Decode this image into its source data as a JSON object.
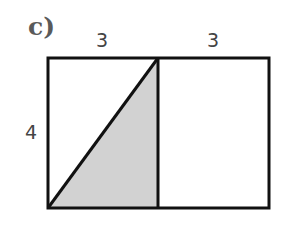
{
  "part_label": "c)",
  "dimensions": {
    "top_left_width": "3",
    "top_right_width": "3",
    "left_height": "4"
  },
  "figure": {
    "shapes": [
      {
        "type": "rectangle",
        "width": 6,
        "height": 4
      },
      {
        "type": "divider",
        "at_x": 3
      },
      {
        "type": "shaded-triangle",
        "vertices": [
          [
            0,
            0
          ],
          [
            3,
            4
          ],
          [
            3,
            0
          ]
        ]
      }
    ],
    "colors": {
      "stroke": "#111111",
      "shade": "#d2d2d2",
      "background": "#ffffff"
    }
  }
}
